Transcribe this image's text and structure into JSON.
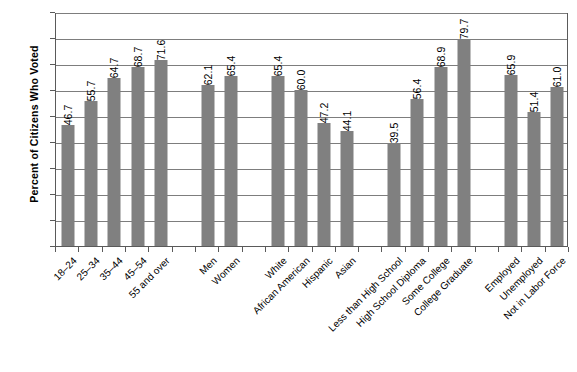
{
  "chart_data": {
    "type": "bar",
    "title": "",
    "xlabel": "",
    "ylabel": "Percent of Citizens Who Voted",
    "ylim": [
      0,
      90
    ],
    "ytick_step": 10,
    "yticks": [
      90,
      80,
      70,
      60,
      50,
      40,
      30,
      20,
      10,
      0
    ],
    "grid": true,
    "legend": "none",
    "bar_color": "#808080",
    "categories": [
      "18–24",
      "25–34",
      "35–44",
      "45–54",
      "55 and over",
      "Men",
      "Women",
      "White",
      "African American",
      "Hispanic",
      "Asian",
      "Less than High School",
      "High School Diploma",
      "Some College",
      "College Graduate",
      "Employed",
      "Unemployed",
      "Not in Labor Force"
    ],
    "values": [
      46.7,
      55.7,
      64.7,
      68.7,
      71.6,
      62.1,
      65.4,
      65.4,
      60.0,
      47.2,
      44.1,
      39.5,
      56.4,
      68.9,
      79.7,
      65.9,
      51.4,
      61.0
    ],
    "value_labels": [
      "46.7",
      "55.7",
      "64.7",
      "68.7",
      "71.6",
      "62.1",
      "65.4",
      "65.4",
      "60.0",
      "47.2",
      "44.1",
      "39.5",
      "56.4",
      "68.9",
      "79.7",
      "65.9",
      "51.4",
      "61.0"
    ],
    "groups": [
      {
        "name": "Age",
        "count": 5
      },
      {
        "name": "Gender",
        "count": 2
      },
      {
        "name": "Race/Ethnicity",
        "count": 4
      },
      {
        "name": "Education",
        "count": 4
      },
      {
        "name": "Employment Status",
        "count": 3
      }
    ],
    "slots": [
      {
        "type": "bar",
        "index": 0
      },
      {
        "type": "bar",
        "index": 1
      },
      {
        "type": "bar",
        "index": 2
      },
      {
        "type": "bar",
        "index": 3
      },
      {
        "type": "bar",
        "index": 4
      },
      {
        "type": "gap"
      },
      {
        "type": "bar",
        "index": 5
      },
      {
        "type": "bar",
        "index": 6
      },
      {
        "type": "gap"
      },
      {
        "type": "bar",
        "index": 7
      },
      {
        "type": "bar",
        "index": 8
      },
      {
        "type": "bar",
        "index": 9
      },
      {
        "type": "bar",
        "index": 10
      },
      {
        "type": "gap"
      },
      {
        "type": "bar",
        "index": 11
      },
      {
        "type": "bar",
        "index": 12
      },
      {
        "type": "bar",
        "index": 13
      },
      {
        "type": "bar",
        "index": 14
      },
      {
        "type": "gap"
      },
      {
        "type": "bar",
        "index": 15
      },
      {
        "type": "bar",
        "index": 16
      },
      {
        "type": "bar",
        "index": 17
      }
    ]
  }
}
